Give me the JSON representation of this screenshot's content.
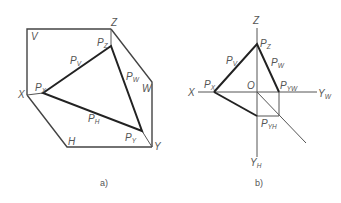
{
  "figure_a": {
    "caption": "a)",
    "vertices": {
      "X": "X",
      "Y": "Y",
      "Z": "Z"
    },
    "planes": {
      "V": "V",
      "H": "H",
      "W": "W"
    },
    "traces": {
      "PV": "V",
      "PH": "H",
      "PW": "W"
    },
    "points": {
      "PX": "X",
      "PY": "Y",
      "PZ": "Z"
    },
    "base": "P"
  },
  "figure_b": {
    "caption": "b)",
    "axes": {
      "X": "X",
      "Z": "Z",
      "YW": "Y",
      "YW_sub": "W",
      "YH": "Y",
      "YH_sub": "H",
      "O": "O"
    },
    "traces": {
      "PV": "V",
      "PW": "W"
    },
    "points": {
      "PX": "X",
      "PZ": "Z",
      "PYW": "YW",
      "PYH": "YH"
    },
    "base": "P"
  }
}
